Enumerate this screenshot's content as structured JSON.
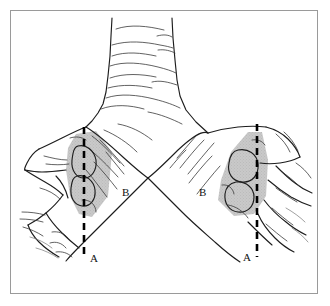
{
  "figure": {
    "frame": {
      "border_color": "#9a9a9a",
      "background_color": "#ffffff"
    },
    "line_color": "#1d1d1d",
    "shade_color": "#b9b9b9",
    "cut_line_color": "#000000"
  },
  "labels": [
    {
      "id": "label-a-left",
      "text": "A",
      "x": 90,
      "y": 262,
      "side": "left",
      "meaning": "level-a-left-bronchus"
    },
    {
      "id": "label-a-right",
      "text": "A",
      "x": 243,
      "y": 261,
      "side": "right",
      "meaning": "level-a-right-bronchus"
    },
    {
      "id": "label-b-left",
      "text": "B",
      "x": 122,
      "y": 196,
      "side": "left",
      "meaning": "level-b-left-bronchus"
    },
    {
      "id": "label-b-right",
      "text": "B",
      "x": 199,
      "y": 196,
      "side": "right",
      "meaning": "level-b-right-bronchus"
    }
  ],
  "cut_lines": [
    {
      "id": "cut-line-left",
      "x": 84,
      "y_top": 127,
      "y_bottom": 258
    },
    {
      "id": "cut-line-right",
      "x": 257,
      "y_top": 124,
      "y_bottom": 257
    }
  ],
  "shaded_regions": [
    {
      "id": "shaded-region-left",
      "description": "lymph-node-bearing tissue left bronchus"
    },
    {
      "id": "shaded-region-right",
      "description": "lymph-node-bearing tissue right bronchus"
    }
  ],
  "structures": {
    "trachea": "trachea-with-cartilage-rings",
    "carina": "carina-peak",
    "left_main_bronchus": "left-main-bronchus",
    "right_main_bronchus": "right-main-bronchus",
    "lobar_branches": "peripheral-lobar-bronchial-branches"
  }
}
